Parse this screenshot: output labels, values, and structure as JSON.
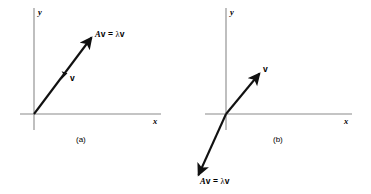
{
  "figure": {
    "background_color": "#ffffff",
    "axis_color": "#8a8a8a",
    "vector_color": "#111111",
    "panels": [
      {
        "id": "a",
        "caption": "(a)",
        "x_axis_label": "x",
        "y_axis_label": "y",
        "vector_label": "v",
        "image_label_prefix": "A",
        "image_label_vec1": "v",
        "image_label_eq": " = ",
        "image_label_lambda": "λ",
        "image_label_vec2": "v",
        "image_label_full": "Av = λv",
        "origin": {
          "x": 34,
          "y": 114
        },
        "x_axis": {
          "x1": 20,
          "y1": 114,
          "x2": 161,
          "y2": 114
        },
        "y_axis": {
          "x1": 34,
          "y1": 8,
          "x2": 34,
          "y2": 130
        },
        "vector_tip": {
          "x": 94,
          "y": 34
        },
        "mid_arrow": {
          "x": 65,
          "y": 76
        },
        "description": "Vector v and its image Av = λv point in the same direction (positive eigenvalue), Av longer than v"
      },
      {
        "id": "b",
        "caption": "(b)",
        "x_axis_label": "x",
        "y_axis_label": "y",
        "vector_label": "v",
        "image_label_prefix": "A",
        "image_label_vec1": "v",
        "image_label_eq": " = ",
        "image_label_lambda": "λ",
        "image_label_vec2": "v",
        "image_label_full": "Av = λv",
        "origin": {
          "x": 226,
          "y": 114
        },
        "x_axis": {
          "x1": 205,
          "y1": 114,
          "x2": 352,
          "y2": 114
        },
        "y_axis": {
          "x1": 226,
          "y1": 8,
          "x2": 226,
          "y2": 130
        },
        "vector_tip": {
          "x": 262,
          "y": 70
        },
        "image_tip": {
          "x": 196,
          "y": 178
        },
        "description": "Vector v points into quadrant I while its image Av = λv points into quadrant III (negative eigenvalue)"
      }
    ]
  }
}
